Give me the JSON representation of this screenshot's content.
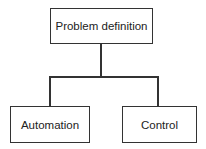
{
  "diagram": {
    "type": "tree",
    "root": {
      "label": "Problem definition"
    },
    "children": [
      {
        "label": "Automation"
      },
      {
        "label": "Control"
      }
    ],
    "line_color": "#333333",
    "background": "#ffffff"
  }
}
